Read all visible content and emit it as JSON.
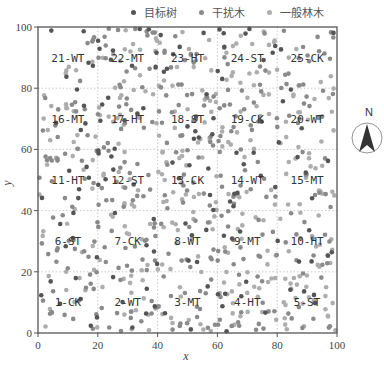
{
  "chart_data": {
    "type": "scatter",
    "title": "",
    "xlabel": "x",
    "ylabel": "y",
    "xlim": [
      0,
      100
    ],
    "ylim": [
      0,
      100
    ],
    "x_ticks": [
      0,
      20,
      40,
      60,
      80,
      100
    ],
    "y_ticks": [
      0,
      20,
      40,
      60,
      80,
      100
    ],
    "grid": "dotted, every 20 units",
    "legend_position": "top",
    "series": [
      {
        "name": "目标树",
        "color": "#555555",
        "approx_count": 140
      },
      {
        "name": "干扰木",
        "color": "#8a8a8a",
        "approx_count": 330
      },
      {
        "name": "一般林木",
        "color": "#adadad",
        "approx_count": 330
      }
    ],
    "plots": [
      {
        "id": 1,
        "label": "1-CK",
        "x": [
          0,
          20
        ],
        "y": [
          0,
          20
        ]
      },
      {
        "id": 2,
        "label": "2-WT",
        "x": [
          20,
          40
        ],
        "y": [
          0,
          20
        ]
      },
      {
        "id": 3,
        "label": "3-MT",
        "x": [
          40,
          60
        ],
        "y": [
          0,
          20
        ]
      },
      {
        "id": 4,
        "label": "4-HT",
        "x": [
          60,
          80
        ],
        "y": [
          0,
          20
        ]
      },
      {
        "id": 5,
        "label": "5-ST",
        "x": [
          80,
          100
        ],
        "y": [
          0,
          20
        ]
      },
      {
        "id": 6,
        "label": "6-ST",
        "x": [
          0,
          20
        ],
        "y": [
          20,
          40
        ]
      },
      {
        "id": 7,
        "label": "7-CK",
        "x": [
          20,
          40
        ],
        "y": [
          20,
          40
        ]
      },
      {
        "id": 8,
        "label": "8-WT",
        "x": [
          40,
          60
        ],
        "y": [
          20,
          40
        ]
      },
      {
        "id": 9,
        "label": "9-MT",
        "x": [
          60,
          80
        ],
        "y": [
          20,
          40
        ]
      },
      {
        "id": 10,
        "label": "10-HT",
        "x": [
          80,
          100
        ],
        "y": [
          20,
          40
        ]
      },
      {
        "id": 11,
        "label": "11-HT",
        "x": [
          0,
          20
        ],
        "y": [
          40,
          60
        ]
      },
      {
        "id": 12,
        "label": "12-ST",
        "x": [
          20,
          40
        ],
        "y": [
          40,
          60
        ]
      },
      {
        "id": 13,
        "label": "13-CK",
        "x": [
          40,
          60
        ],
        "y": [
          40,
          60
        ]
      },
      {
        "id": 14,
        "label": "14-WT",
        "x": [
          60,
          80
        ],
        "y": [
          40,
          60
        ]
      },
      {
        "id": 15,
        "label": "15-MT",
        "x": [
          80,
          100
        ],
        "y": [
          40,
          60
        ]
      },
      {
        "id": 16,
        "label": "16-MT",
        "x": [
          0,
          20
        ],
        "y": [
          60,
          80
        ]
      },
      {
        "id": 17,
        "label": "17-HT",
        "x": [
          20,
          40
        ],
        "y": [
          60,
          80
        ]
      },
      {
        "id": 18,
        "label": "18-ST",
        "x": [
          40,
          60
        ],
        "y": [
          60,
          80
        ]
      },
      {
        "id": 19,
        "label": "19-CK",
        "x": [
          60,
          80
        ],
        "y": [
          60,
          80
        ]
      },
      {
        "id": 20,
        "label": "20-WT",
        "x": [
          80,
          100
        ],
        "y": [
          60,
          80
        ]
      },
      {
        "id": 21,
        "label": "21-WT",
        "x": [
          0,
          20
        ],
        "y": [
          80,
          100
        ]
      },
      {
        "id": 22,
        "label": "22-MT",
        "x": [
          20,
          40
        ],
        "y": [
          80,
          100
        ]
      },
      {
        "id": 23,
        "label": "23-HT",
        "x": [
          40,
          60
        ],
        "y": [
          80,
          100
        ]
      },
      {
        "id": 24,
        "label": "24-ST",
        "x": [
          60,
          80
        ],
        "y": [
          80,
          100
        ]
      },
      {
        "id": 25,
        "label": "25-CK",
        "x": [
          80,
          100
        ],
        "y": [
          80,
          100
        ]
      }
    ],
    "annotations": [
      "N"
    ]
  },
  "legend": {
    "items": [
      {
        "label": "目标树",
        "color": "#555555"
      },
      {
        "label": "干扰木",
        "color": "#8a8a8a"
      },
      {
        "label": "一般林木",
        "color": "#adadad"
      }
    ]
  },
  "north_arrow": {
    "label": "N",
    "icon": "north-arrow-icon"
  },
  "layout": {
    "plot_left": 38,
    "plot_right": 337,
    "plot_top": 27,
    "plot_bottom": 333,
    "frame_color": "#555555",
    "grid_color": "#bbbbbb"
  }
}
